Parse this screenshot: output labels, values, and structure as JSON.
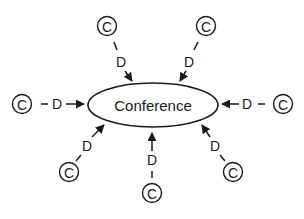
{
  "diagram": {
    "type": "hub-and-spoke",
    "hub": {
      "label": "Conference",
      "cx": 153,
      "cy": 105,
      "rx": 65,
      "ry": 22
    },
    "node_symbol": "C",
    "edge_label": "D",
    "colors": {
      "stroke": "#1a1a1a",
      "background": "#ffffff"
    },
    "spokes": [
      {
        "id": "top-left",
        "node": {
          "x": 107,
          "y": 26
        },
        "label_pos": {
          "x": 121,
          "y": 62
        },
        "line_start": {
          "x": 114,
          "y": 42
        },
        "line_end": {
          "x": 117,
          "y": 50
        },
        "arrow_from": {
          "x": 125,
          "y": 71
        },
        "arrow_to": {
          "x": 132,
          "y": 81
        }
      },
      {
        "id": "top-right",
        "node": {
          "x": 206,
          "y": 26
        },
        "label_pos": {
          "x": 189,
          "y": 62
        },
        "line_start": {
          "x": 198,
          "y": 42
        },
        "line_end": {
          "x": 194,
          "y": 50
        },
        "arrow_from": {
          "x": 186,
          "y": 71
        },
        "arrow_to": {
          "x": 180,
          "y": 81
        }
      },
      {
        "id": "left",
        "node": {
          "x": 22,
          "y": 104
        },
        "label_pos": {
          "x": 57,
          "y": 104
        },
        "line_start": {
          "x": 41,
          "y": 104
        },
        "line_end": {
          "x": 48,
          "y": 104
        },
        "arrow_from": {
          "x": 66,
          "y": 104
        },
        "arrow_to": {
          "x": 84,
          "y": 104
        }
      },
      {
        "id": "right",
        "node": {
          "x": 283,
          "y": 104
        },
        "label_pos": {
          "x": 247,
          "y": 104
        },
        "line_start": {
          "x": 258,
          "y": 104
        },
        "line_end": {
          "x": 265,
          "y": 104
        },
        "arrow_from": {
          "x": 239,
          "y": 104
        },
        "arrow_to": {
          "x": 222,
          "y": 104
        }
      },
      {
        "id": "bottom-left",
        "node": {
          "x": 69,
          "y": 172
        },
        "label_pos": {
          "x": 87,
          "y": 146
        },
        "line_start": {
          "x": 76,
          "y": 161
        },
        "line_end": {
          "x": 81,
          "y": 155
        },
        "arrow_from": {
          "x": 92,
          "y": 137
        },
        "arrow_to": {
          "x": 104,
          "y": 125
        }
      },
      {
        "id": "bottom",
        "node": {
          "x": 152,
          "y": 193
        },
        "label_pos": {
          "x": 152,
          "y": 160
        },
        "line_start": {
          "x": 152,
          "y": 171
        },
        "line_end": {
          "x": 152,
          "y": 178
        },
        "arrow_from": {
          "x": 152,
          "y": 151
        },
        "arrow_to": {
          "x": 152,
          "y": 133
        }
      },
      {
        "id": "bottom-right",
        "node": {
          "x": 233,
          "y": 172
        },
        "label_pos": {
          "x": 215,
          "y": 146
        },
        "line_start": {
          "x": 220,
          "y": 155
        },
        "line_end": {
          "x": 225,
          "y": 161
        },
        "arrow_from": {
          "x": 210,
          "y": 137
        },
        "arrow_to": {
          "x": 202,
          "y": 125
        }
      }
    ]
  }
}
